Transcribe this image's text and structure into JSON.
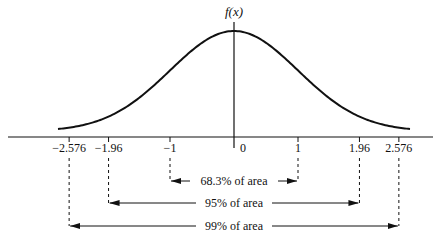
{
  "chart_data": {
    "type": "line",
    "title": "",
    "ylabel": "f(x)",
    "xlabel": "",
    "curve": "standard normal density",
    "xlim": [
      -3.2,
      3.0
    ],
    "ticks": [
      {
        "value": -2.576,
        "label": "−2.576"
      },
      {
        "value": -1.96,
        "label": "−1.96"
      },
      {
        "value": -1,
        "label": "−1"
      },
      {
        "value": 0,
        "label": "0"
      },
      {
        "value": 1,
        "label": "1"
      },
      {
        "value": 1.96,
        "label": "1.96"
      },
      {
        "value": 2.576,
        "label": "2.576"
      }
    ],
    "intervals": [
      {
        "from": -1,
        "to": 1,
        "label": "68.3% of area"
      },
      {
        "from": -1.96,
        "to": 1.96,
        "label": "95% of area"
      },
      {
        "from": -2.576,
        "to": 2.576,
        "label": "99% of area"
      }
    ]
  }
}
